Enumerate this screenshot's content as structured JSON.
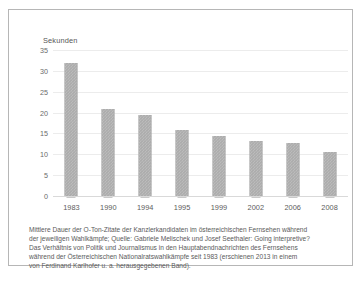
{
  "chart_data": {
    "type": "bar",
    "title": "",
    "ylabel": "Sekunden",
    "xlabel": "",
    "categories": [
      "1983",
      "1990",
      "1994",
      "1995",
      "1999",
      "2002",
      "2006",
      "2008"
    ],
    "values": [
      32.0,
      20.8,
      19.4,
      15.8,
      14.4,
      13.1,
      12.8,
      10.5
    ],
    "ylim": [
      0,
      35
    ],
    "yticks": [
      "35",
      "30",
      "25",
      "20",
      "15",
      "10",
      "5",
      "0"
    ],
    "ytick_values": [
      35,
      30,
      25,
      20,
      15,
      10,
      5,
      0
    ],
    "grid": true,
    "legend": "none",
    "bar_color": "#9d9d9d",
    "gridline_color": "#ececec"
  },
  "caption": {
    "line1": "Mittlere Dauer der O-Ton-Zitate der Kanzlerkandidaten im österreichischen Fernsehen während",
    "line2": "der jeweiligen Wahlkämpfe; Quelle: Gabriele Melischek und Josef Seethaler: Going interpretive?",
    "line3": "Das Verhältnis von Politik und Journalismus in den Hauptabendnachrichten des Fernsehens",
    "line4": "während der Österreichischen Nationalratswahlkämpfe seit 1983 (erschienen 2013 in einem",
    "line5": "von Ferdinand Karlhofer u. a. herausgegebenen Band)."
  }
}
